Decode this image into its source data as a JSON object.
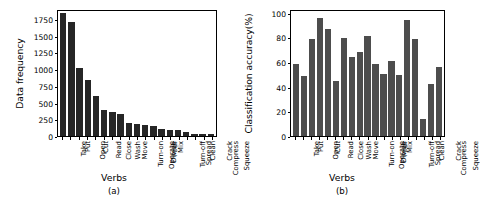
{
  "figure": {
    "width": 456,
    "height": 207,
    "background": "#ffffff"
  },
  "panels": [
    {
      "caption": "(a)",
      "xlabel": "Verbs",
      "ylabel": "Data frequency",
      "bar_color": "#262626"
    },
    {
      "caption": "(b)",
      "xlabel": "Verbs",
      "ylabel": "Classification accuracy(%)",
      "bar_color": "#4d4d4d"
    }
  ],
  "chart_data": [
    {
      "type": "bar",
      "title": "",
      "subtitle": "(a)",
      "xlabel": "Verbs",
      "ylabel": "Data frequency",
      "ylim": [
        0,
        1900
      ],
      "yticks": [
        0,
        250,
        500,
        750,
        1000,
        1250,
        1500,
        1750
      ],
      "ytick_labels": [
        "0",
        "250",
        "500",
        "750",
        "1000",
        "1250",
        "1500",
        "1750"
      ],
      "grid": false,
      "legend": null,
      "bar_color": "#262626",
      "categories": [
        "Take",
        "Put",
        "Open",
        "Cut",
        "Read",
        "Close",
        "Wash",
        "Move",
        "Turn-on",
        "Operate",
        "Divide",
        "Pour",
        "Mix",
        "Turn-off",
        "Spread",
        "Clean",
        "Compress",
        "Crack",
        "Squeeze"
      ],
      "values": [
        1865,
        1730,
        1035,
        845,
        605,
        400,
        360,
        330,
        205,
        190,
        165,
        145,
        100,
        90,
        85,
        65,
        25,
        25,
        25
      ]
    },
    {
      "type": "bar",
      "title": "",
      "subtitle": "(b)",
      "xlabel": "Verbs",
      "ylabel": "Classification accuracy(%)",
      "ylim": [
        0,
        103
      ],
      "yticks": [
        0,
        20,
        40,
        60,
        80,
        100
      ],
      "ytick_labels": [
        "0",
        "20",
        "40",
        "60",
        "80",
        "100"
      ],
      "grid": false,
      "legend": null,
      "bar_color": "#4d4d4d",
      "categories": [
        "Take",
        "Put",
        "Open",
        "Cut",
        "Read",
        "Close",
        "Wash",
        "Move",
        "Turn-on",
        "Operate",
        "Divide",
        "Pour",
        "Mix",
        "Turn-off",
        "Spread",
        "Clean",
        "Compress",
        "Crack",
        "Squeeze"
      ],
      "values": [
        59,
        49.5,
        80,
        97,
        88,
        45.5,
        81,
        65.5,
        69,
        82.5,
        59,
        51.5,
        61.5,
        50,
        95.5,
        80,
        14,
        42.5,
        57
      ]
    }
  ]
}
